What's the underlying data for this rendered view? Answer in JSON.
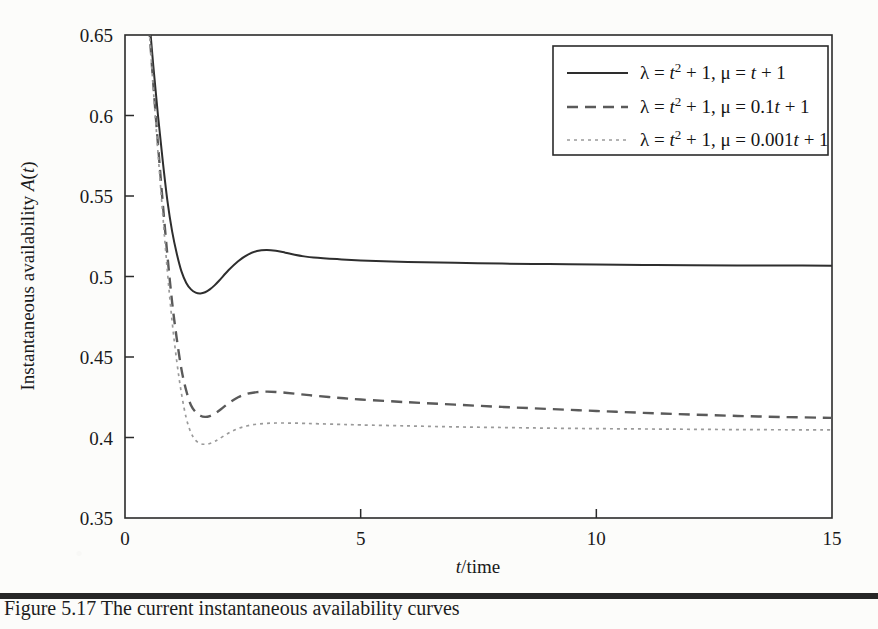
{
  "figure": {
    "background_color": "#fcfcfa",
    "frame_color": "#2b2b2b"
  },
  "caption": {
    "text": "Figure 5.17   The current instantaneous availability curves"
  },
  "chart_data": {
    "type": "line",
    "title": "",
    "xlabel": "t/time",
    "ylabel": "Instantaneous availability A(t)",
    "xlim": [
      0,
      15
    ],
    "ylim": [
      0.35,
      0.65
    ],
    "xticks": [
      0,
      5,
      10,
      15
    ],
    "xtick_labels": [
      "0",
      "5",
      "10",
      "15"
    ],
    "yticks": [
      0.35,
      0.4,
      0.45,
      0.5,
      0.55,
      0.6,
      0.65
    ],
    "ytick_labels": [
      "0.35",
      "0.4",
      "0.45",
      "0.5",
      "0.55",
      "0.6",
      "0.65"
    ],
    "grid": false,
    "legend_position": "upper right",
    "series": [
      {
        "name": "lambda-t2-mu-t",
        "style": "solid",
        "color": "#2e2e2e",
        "legend_parts": {
          "lambda_sym": "λ",
          "lambda_expr": "t",
          "lambda_sup": "2",
          "lambda_tail": "+ 1,",
          "mu_sym": "μ",
          "mu_expr": "t + 1"
        },
        "x": [
          0.4,
          0.5,
          0.6,
          0.7,
          0.8,
          0.9,
          1.0,
          1.1,
          1.2,
          1.3,
          1.4,
          1.5,
          1.6,
          1.7,
          1.8,
          1.9,
          2.0,
          2.2,
          2.4,
          2.6,
          2.8,
          3.0,
          3.2,
          3.4,
          3.6,
          3.8,
          4.0,
          4.5,
          5.0,
          6.0,
          7.0,
          8.0,
          9.0,
          10.0,
          11.0,
          12.0,
          13.0,
          14.0,
          15.0
        ],
        "y": [
          0.7,
          0.665,
          0.631,
          0.6,
          0.572,
          0.547,
          0.528,
          0.514,
          0.503,
          0.496,
          0.492,
          0.49,
          0.4895,
          0.4902,
          0.492,
          0.4945,
          0.4975,
          0.504,
          0.5095,
          0.5135,
          0.5158,
          0.5165,
          0.516,
          0.5148,
          0.5135,
          0.5125,
          0.5118,
          0.5108,
          0.51,
          0.509,
          0.5085,
          0.508,
          0.5077,
          0.5074,
          0.5072,
          0.507,
          0.5069,
          0.5068,
          0.5067
        ]
      },
      {
        "name": "lambda-t2-mu-0.1t",
        "style": "dashed",
        "color": "#5a5a5a",
        "legend_parts": {
          "lambda_sym": "λ",
          "lambda_expr": "t",
          "lambda_sup": "2",
          "lambda_tail": "+ 1,",
          "mu_sym": "μ",
          "mu_expr": "0.1t + 1"
        },
        "x": [
          0.4,
          0.5,
          0.6,
          0.7,
          0.8,
          0.9,
          1.0,
          1.1,
          1.2,
          1.3,
          1.4,
          1.5,
          1.6,
          1.7,
          1.8,
          1.9,
          2.0,
          2.2,
          2.4,
          2.6,
          2.8,
          3.0,
          3.2,
          3.4,
          3.6,
          3.8,
          4.0,
          4.5,
          5.0,
          6.0,
          7.0,
          8.0,
          9.0,
          10.0,
          11.0,
          12.0,
          13.0,
          14.0,
          15.0
        ],
        "y": [
          0.7,
          0.66,
          0.62,
          0.582,
          0.546,
          0.513,
          0.484,
          0.461,
          0.442,
          0.429,
          0.42,
          0.4158,
          0.4135,
          0.4128,
          0.4133,
          0.4148,
          0.4168,
          0.4213,
          0.425,
          0.4272,
          0.4282,
          0.4285,
          0.4283,
          0.4278,
          0.4272,
          0.4266,
          0.426,
          0.4247,
          0.4236,
          0.4219,
          0.4204,
          0.419,
          0.4177,
          0.4165,
          0.4153,
          0.4143,
          0.4134,
          0.4127,
          0.4122
        ]
      },
      {
        "name": "lambda-t2-mu-0.001t",
        "style": "dotted",
        "color": "#9a9a9a",
        "legend_parts": {
          "lambda_sym": "λ",
          "lambda_expr": "t",
          "lambda_sup": "2",
          "lambda_tail": "+ 1,",
          "mu_sym": "μ",
          "mu_expr": "0.001t + 1"
        },
        "x": [
          0.4,
          0.5,
          0.6,
          0.7,
          0.8,
          0.9,
          1.0,
          1.1,
          1.2,
          1.3,
          1.4,
          1.5,
          1.6,
          1.7,
          1.8,
          1.9,
          2.0,
          2.2,
          2.4,
          2.6,
          2.8,
          3.0,
          3.2,
          3.4,
          3.6,
          3.8,
          4.0,
          4.5,
          5.0,
          6.0,
          7.0,
          8.0,
          9.0,
          10.0,
          11.0,
          12.0,
          13.0,
          14.0,
          15.0
        ],
        "y": [
          0.7,
          0.659,
          0.617,
          0.577,
          0.539,
          0.503,
          0.472,
          0.447,
          0.427,
          0.412,
          0.403,
          0.3982,
          0.3962,
          0.3958,
          0.3963,
          0.3975,
          0.3992,
          0.4028,
          0.4056,
          0.4073,
          0.4083,
          0.4088,
          0.409,
          0.409,
          0.4089,
          0.4088,
          0.4086,
          0.4082,
          0.4078,
          0.4072,
          0.4066,
          0.4062,
          0.4058,
          0.4055,
          0.4053,
          0.4051,
          0.4049,
          0.4048,
          0.4047
        ]
      }
    ]
  }
}
